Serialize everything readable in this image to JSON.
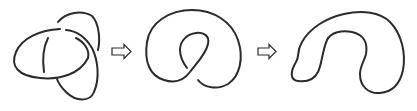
{
  "diagram": {
    "description": "Knot simplification sequence",
    "stages": [
      {
        "id": "trefoil",
        "label": "Trefoil-like knot diagram with three crossings"
      },
      {
        "id": "twisted-loop",
        "label": "Loop with a single twist (one crossing)"
      },
      {
        "id": "unknot",
        "label": "Unknot (simple closed curve)"
      }
    ],
    "arrows": [
      {
        "from": "trefoil",
        "to": "twisted-loop",
        "icon": "hollow-right-arrow"
      },
      {
        "from": "twisted-loop",
        "to": "unknot",
        "icon": "hollow-right-arrow"
      }
    ],
    "colors": {
      "stroke": "#2b2b2b",
      "background": "#ffffff"
    }
  }
}
